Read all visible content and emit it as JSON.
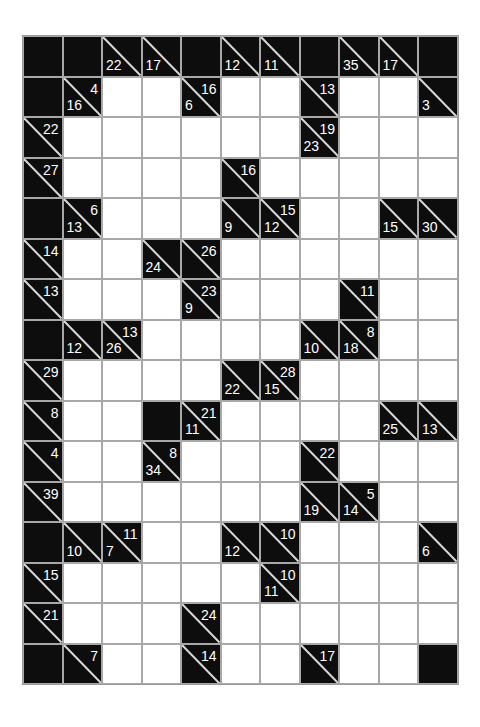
{
  "puzzle": {
    "type": "Kakuro",
    "columns": 11,
    "rows": 16,
    "colors": {
      "block": "#0d0d0d",
      "white": "#ffffff",
      "grid_line": "#a8a8a8",
      "clue_text": "#ffffff"
    },
    "legend": {
      "W": "white entry cell",
      "B": "solid black block",
      "a": "across clue (top-right)",
      "d": "down clue (bottom-left)"
    },
    "grid": [
      [
        "B",
        "B",
        {
          "d": "22"
        },
        {
          "d": "17"
        },
        "B",
        {
          "d": "12"
        },
        {
          "d": "11"
        },
        "B",
        {
          "d": "35"
        },
        {
          "d": "17"
        },
        "B"
      ],
      [
        "B",
        {
          "d": "16",
          "a": "4"
        },
        "W",
        "W",
        {
          "d": "6",
          "a": "16"
        },
        "W",
        "W",
        {
          "a": "13"
        },
        "W",
        "W",
        {
          "d": "3"
        }
      ],
      [
        {
          "a": "22"
        },
        "W",
        "W",
        "W",
        "W",
        "W",
        "W",
        {
          "d": "23",
          "a": "19"
        },
        "W",
        "W",
        "W"
      ],
      [
        {
          "a": "27"
        },
        "W",
        "W",
        "W",
        "W",
        {
          "a": "16"
        },
        "W",
        "W",
        "W",
        "W",
        "W"
      ],
      [
        "B",
        {
          "d": "13",
          "a": "6"
        },
        "W",
        "W",
        "W",
        {
          "d": "9"
        },
        {
          "d": "12",
          "a": "15"
        },
        "W",
        "W",
        {
          "d": "15"
        },
        {
          "d": "30"
        }
      ],
      [
        {
          "a": "14"
        },
        "W",
        "W",
        {
          "d": "24"
        },
        {
          "a": "26"
        },
        "W",
        "W",
        "W",
        "W",
        "W",
        "W"
      ],
      [
        {
          "a": "13"
        },
        "W",
        "W",
        "W",
        {
          "d": "9",
          "a": "23"
        },
        "W",
        "W",
        "W",
        {
          "a": "11"
        },
        "W",
        "W"
      ],
      [
        "B",
        {
          "d": "12"
        },
        {
          "d": "26",
          "a": "13"
        },
        "W",
        "W",
        "W",
        "W",
        {
          "d": "10"
        },
        {
          "d": "18",
          "a": "8"
        },
        "W",
        "W"
      ],
      [
        {
          "a": "29"
        },
        "W",
        "W",
        "W",
        "W",
        {
          "d": "22"
        },
        {
          "d": "15",
          "a": "28"
        },
        "W",
        "W",
        "W",
        "W"
      ],
      [
        {
          "a": "8"
        },
        "W",
        "W",
        "B",
        {
          "d": "11",
          "a": "21"
        },
        "W",
        "W",
        "W",
        "W",
        {
          "d": "25"
        },
        {
          "d": "13"
        }
      ],
      [
        {
          "a": "4"
        },
        "W",
        "W",
        {
          "d": "34",
          "a": "8"
        },
        "W",
        "W",
        "W",
        {
          "a": "22"
        },
        "W",
        "W",
        "W"
      ],
      [
        {
          "a": "39"
        },
        "W",
        "W",
        "W",
        "W",
        "W",
        "W",
        {
          "d": "19"
        },
        {
          "d": "14",
          "a": "5"
        },
        "W",
        "W"
      ],
      [
        "B",
        {
          "d": "10"
        },
        {
          "d": "7",
          "a": "11"
        },
        "W",
        "W",
        {
          "d": "12"
        },
        {
          "a": "10"
        },
        "W",
        "W",
        "W",
        {
          "d": "6"
        }
      ],
      [
        {
          "a": "15"
        },
        "W",
        "W",
        "W",
        "W",
        "W",
        {
          "d": "11",
          "a": "10"
        },
        "W",
        "W",
        "W",
        "W"
      ],
      [
        {
          "a": "21"
        },
        "W",
        "W",
        "W",
        {
          "a": "24"
        },
        "W",
        "W",
        "W",
        "W",
        "W",
        "W"
      ],
      [
        "B",
        {
          "a": "7"
        },
        "W",
        "W",
        {
          "a": "14"
        },
        "W",
        "W",
        {
          "a": "17"
        },
        "W",
        "W",
        "B"
      ]
    ]
  }
}
